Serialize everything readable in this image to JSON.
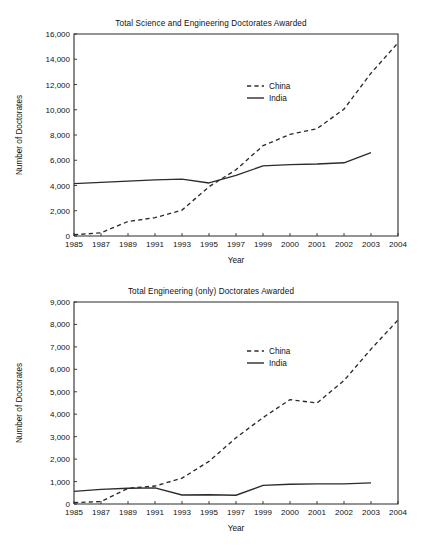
{
  "document": {
    "kind": "two-panel line chart figure",
    "background_color": "#ffffff",
    "ink_color": "#2b2b2b"
  },
  "chart_data": [
    {
      "id": "science-and-engineering",
      "type": "line",
      "title": "Total Science and Engineering Doctorates Awarded",
      "xlabel": "Year",
      "ylabel": "Number of Doctorates",
      "categories": [
        "1985",
        "1987",
        "1989",
        "1991",
        "1993",
        "1995",
        "1997",
        "1999",
        "2000",
        "2001",
        "2002",
        "2003",
        "2004"
      ],
      "xtick_labels": [
        "1985",
        "1987",
        "1989",
        "1991",
        "1993",
        "1995",
        "1997",
        "1999",
        "2000",
        "2001",
        "2002",
        "2003",
        "2004"
      ],
      "ytick_labels": [
        "0",
        "2,000",
        "4,000",
        "6,000",
        "8,000",
        "10,000",
        "12,000",
        "14,000",
        "16,000"
      ],
      "ytick_values": [
        0,
        2000,
        4000,
        6000,
        8000,
        10000,
        12000,
        14000,
        16000
      ],
      "ylim": [
        0,
        16000
      ],
      "grid": false,
      "legend_position": "upper-center",
      "series": [
        {
          "name": "China",
          "style": "dashed",
          "color": "#2b2b2b",
          "values": [
            100,
            250,
            1150,
            1450,
            2050,
            3900,
            5250,
            7150,
            8050,
            8500,
            10050,
            12900,
            15300
          ]
        },
        {
          "name": "India",
          "style": "solid",
          "color": "#2b2b2b",
          "values": [
            4150,
            4250,
            4350,
            4450,
            4500,
            4200,
            4800,
            5550,
            5650,
            5700,
            5800,
            6600,
            null
          ]
        }
      ]
    },
    {
      "id": "engineering-only",
      "type": "line",
      "title": "Total Engineering (only) Doctorates Awarded",
      "xlabel": "Year",
      "ylabel": "Number of Doctorates",
      "categories": [
        "1985",
        "1987",
        "1989",
        "1991",
        "1993",
        "1995",
        "1997",
        "1999",
        "2000",
        "2001",
        "2002",
        "2003",
        "2004"
      ],
      "xtick_labels": [
        "1985",
        "1987",
        "1989",
        "1991",
        "1993",
        "1995",
        "1997",
        "1999",
        "2000",
        "2001",
        "2002",
        "2003",
        "2004"
      ],
      "ytick_labels": [
        "0",
        "1,000",
        "2,000",
        "3,000",
        "4,000",
        "5,000",
        "6,000",
        "7,000",
        "8,000",
        "9,000"
      ],
      "ytick_values": [
        0,
        1000,
        2000,
        3000,
        4000,
        5000,
        6000,
        7000,
        8000,
        9000
      ],
      "ylim": [
        0,
        9000
      ],
      "grid": false,
      "legend_position": "upper-center",
      "series": [
        {
          "name": "China",
          "style": "dashed",
          "color": "#2b2b2b",
          "values": [
            60,
            110,
            700,
            800,
            1150,
            1900,
            2950,
            3850,
            4650,
            4500,
            5500,
            6900,
            8200
          ]
        },
        {
          "name": "India",
          "style": "solid",
          "color": "#2b2b2b",
          "values": [
            560,
            650,
            700,
            720,
            400,
            410,
            390,
            830,
            880,
            900,
            900,
            940,
            null
          ]
        }
      ]
    }
  ],
  "legend": {
    "china_label": "China",
    "india_label": "India"
  }
}
